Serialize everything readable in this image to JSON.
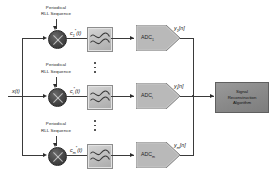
{
  "diagram": {
    "input_signal": "x(t)",
    "colors": {
      "mixer": "#3a3a3a",
      "filter": "#c2c2c2",
      "adc": "#b5b5b5",
      "reconstruction_block": "#8c8c8c",
      "wire": "#3a3a3a"
    },
    "branches": [
      {
        "id": "branch-1",
        "source_label_line1": "Periodical",
        "source_label_line2": "RLL Sequence",
        "mixing_signal": "c",
        "mixing_signal_sub": "1",
        "mixing_signal_star": "*",
        "mixing_signal_arg": "(t)",
        "filter_name": "lowpass-filter",
        "adc_label": "ADC",
        "adc_sub": "1",
        "output": "y",
        "output_sub": "1",
        "output_arg": "[n]"
      },
      {
        "id": "branch-i",
        "source_label_line1": "Periodical",
        "source_label_line2": "RLL Sequence",
        "mixing_signal": "c",
        "mixing_signal_sub": "i",
        "mixing_signal_star": "*",
        "mixing_signal_arg": "(t)",
        "filter_name": "lowpass-filter",
        "adc_label": "ADC",
        "adc_sub": "i",
        "output": "y",
        "output_sub": "i",
        "output_arg": "[n]"
      },
      {
        "id": "branch-m",
        "source_label_line1": "Periodical",
        "source_label_line2": "RLL Sequence",
        "mixing_signal": "c",
        "mixing_signal_sub": "m",
        "mixing_signal_star": "*",
        "mixing_signal_arg": "(t)",
        "filter_name": "lowpass-filter",
        "adc_label": "ADC",
        "adc_sub": "m",
        "output": "y",
        "output_sub": "m",
        "output_arg": "[n]"
      }
    ],
    "reconstruction": {
      "line1": "Signal",
      "line2": "Reconstruction",
      "line3": "Algorithm"
    },
    "ellipsis": {
      "upper": "vertical-ellipsis",
      "lower": "vertical-ellipsis"
    }
  }
}
